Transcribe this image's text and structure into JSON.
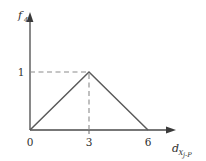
{
  "chart_data": {
    "type": "line",
    "title": "",
    "subtitle": "",
    "xlabel": "d",
    "xlabel_sub": "X j-P",
    "ylabel": "f",
    "ylabel_sub": "4",
    "xlim": [
      0,
      6
    ],
    "ylim": [
      0,
      1
    ],
    "grid": false,
    "legend": null,
    "x": [
      0,
      3,
      6
    ],
    "values": [
      0,
      1,
      0
    ],
    "series": [
      {
        "name": "triangular membership function",
        "points": [
          {
            "x": 0,
            "y": 0
          },
          {
            "x": 3,
            "y": 1
          },
          {
            "x": 6,
            "y": 0
          }
        ]
      }
    ],
    "x_ticks": [
      "0",
      "3",
      "6"
    ],
    "x_tick_values": [
      0,
      3,
      6
    ],
    "y_ticks": [
      "1"
    ],
    "y_tick_values": [
      1
    ],
    "annotations": [
      {
        "name": "peak-horizontal-guide",
        "style": "dashed",
        "from": {
          "x": 0,
          "y": 1
        },
        "to": {
          "x": 3,
          "y": 1
        }
      },
      {
        "name": "peak-vertical-guide",
        "style": "dashed",
        "from": {
          "x": 3,
          "y": 0
        },
        "to": {
          "x": 3,
          "y": 1
        }
      }
    ],
    "colors": {
      "curve": "#5a5a5a",
      "axis": "#4a4a4a",
      "guide": "#8c8c8c",
      "text": "#2f2f2f",
      "background": "#ffffff"
    }
  },
  "axes": {
    "y_axis_label_main": "f",
    "y_axis_label_subscript": "4",
    "x_axis_label_main": "d",
    "x_axis_label_subscript_1": "X",
    "x_axis_label_subscript_2": "j-P",
    "origin_label": "0",
    "y_value_label": "1",
    "x_tick_mid": "3",
    "x_tick_end": "6"
  }
}
